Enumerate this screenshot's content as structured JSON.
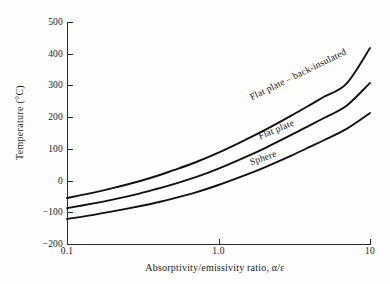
{
  "chart_data": {
    "type": "line",
    "title": "",
    "xlabel": "Absorptivity/emissivity ratio, α/ε",
    "ylabel": "Temperature (°C)",
    "xscale": "log",
    "xlim": [
      0.1,
      10
    ],
    "ylim": [
      -200,
      500
    ],
    "xticks": [
      0.1,
      1.0,
      10
    ],
    "xticklabels": [
      "0.1",
      "1.0",
      "10"
    ],
    "yticks": [
      -200,
      -100,
      0,
      100,
      200,
      300,
      400,
      500
    ],
    "yticklabels": [
      "−200",
      "−100",
      "0",
      "100",
      "200",
      "300",
      "400",
      "500"
    ],
    "grid": false,
    "legend": "inline-curve-labels",
    "line_color": "#111111",
    "axis_color": "#2a2a2a",
    "background": "#fdfdfb",
    "x": [
      0.1,
      0.15,
      0.2,
      0.3,
      0.4,
      0.5,
      0.7,
      1.0,
      1.5,
      2.0,
      3.0,
      4.0,
      5.0,
      7.0,
      10.0
    ],
    "series": [
      {
        "name": "Flat plate – back-insulated",
        "label": "Flat plate – back-insulated",
        "values": [
          -55,
          -38,
          -24,
          -2,
          16,
          32,
          57,
          88,
          128,
          158,
          204,
          238,
          265,
          306,
          418
        ]
      },
      {
        "name": "Flat plate",
        "label": "Flat plate",
        "values": [
          -87,
          -72,
          -60,
          -41,
          -25,
          -12,
          10,
          38,
          74,
          101,
          143,
          174,
          198,
          236,
          308
        ]
      },
      {
        "name": "Sphere",
        "label": "Sphere",
        "values": [
          -121,
          -108,
          -97,
          -81,
          -68,
          -57,
          -38,
          -14,
          17,
          41,
          78,
          106,
          128,
          163,
          213
        ]
      }
    ]
  }
}
